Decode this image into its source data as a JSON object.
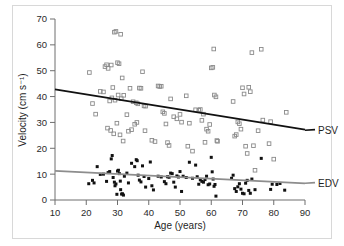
{
  "figure": {
    "background_color": "#ffffff",
    "border_color": "#d8d8d8"
  },
  "chart_data": {
    "type": "scatter",
    "title": "",
    "subtitle": "",
    "xlabel": "Age (years)",
    "ylabel": "Velocity (cm s⁻¹)",
    "xlim": [
      10,
      90
    ],
    "ylim": [
      0,
      70
    ],
    "xticks": [
      10,
      20,
      30,
      40,
      50,
      60,
      70,
      80,
      90
    ],
    "yticks": [
      0,
      10,
      20,
      30,
      40,
      50,
      60,
      70
    ],
    "xtick_labels": [
      "10",
      "20",
      "30",
      "40",
      "50",
      "60",
      "70",
      "80",
      "90"
    ],
    "ytick_labels": [
      "0",
      "10",
      "20",
      "30",
      "40",
      "50",
      "60",
      "70"
    ],
    "grid": false,
    "legend_position": "right-inline-labels",
    "annotations": [
      {
        "text": "PSV",
        "series": "PSV",
        "x": 90,
        "y": 27
      },
      {
        "text": "EDV",
        "series": "EDV",
        "x": 90,
        "y": 6.5
      }
    ],
    "series": [
      {
        "name": "PSV",
        "label": "PSV",
        "marker": "open-square",
        "marker_color": "#8a8a8a",
        "marker_fill": "none",
        "trendline": {
          "color": "#111111",
          "x_start": 10,
          "y_start": 42.8,
          "x_end": 90,
          "y_end": 27.2,
          "slope": -0.195,
          "intercept": 44.75
        },
        "points": [
          [
            21.0,
            49.3
          ],
          [
            22.0,
            37.3
          ],
          [
            23.0,
            33.2
          ],
          [
            24.5,
            42.0
          ],
          [
            25.5,
            41.8
          ],
          [
            26.0,
            51.6
          ],
          [
            26.5,
            52.3
          ],
          [
            27.0,
            50.9
          ],
          [
            28.0,
            52.2
          ],
          [
            28.5,
            43.5
          ],
          [
            29.0,
            64.9
          ],
          [
            29.5,
            65.2
          ],
          [
            30.0,
            53.1
          ],
          [
            30.5,
            52.7
          ],
          [
            31.0,
            64.1
          ],
          [
            31.5,
            47.2
          ],
          [
            27.5,
            38.3
          ],
          [
            28.2,
            39.5
          ],
          [
            29.2,
            38.6
          ],
          [
            30.2,
            40.6
          ],
          [
            31.2,
            39.2
          ],
          [
            32.0,
            40.5
          ],
          [
            33.0,
            33.0
          ],
          [
            34.0,
            43.2
          ],
          [
            35.0,
            38.0
          ],
          [
            36.0,
            37.6
          ],
          [
            36.5,
            37.2
          ],
          [
            37.0,
            43.3
          ],
          [
            37.5,
            43.2
          ],
          [
            38.0,
            49.6
          ],
          [
            38.5,
            36.4
          ],
          [
            39.0,
            36.3
          ],
          [
            26.8,
            27.8
          ],
          [
            27.8,
            26.9
          ],
          [
            28.8,
            25.6
          ],
          [
            29.8,
            29.7
          ],
          [
            30.8,
            25.2
          ],
          [
            31.8,
            22.8
          ],
          [
            33.5,
            26.6
          ],
          [
            34.5,
            27.2
          ],
          [
            35.5,
            29.3
          ],
          [
            36.2,
            30.0
          ],
          [
            38.8,
            26.8
          ],
          [
            41.0,
            23.1
          ],
          [
            42.0,
            22.6
          ],
          [
            43.0,
            44.1
          ],
          [
            43.5,
            43.9
          ],
          [
            44.0,
            44.0
          ],
          [
            44.5,
            34.1
          ],
          [
            45.0,
            33.5
          ],
          [
            45.5,
            29.4
          ],
          [
            46.0,
            22.2
          ],
          [
            46.5,
            21.1
          ],
          [
            47.0,
            39.1
          ],
          [
            48.0,
            32.2
          ],
          [
            49.0,
            31.4
          ],
          [
            50.0,
            33.1
          ],
          [
            50.5,
            30.1
          ],
          [
            52.0,
            40.3
          ],
          [
            52.5,
            20.8
          ],
          [
            53.0,
            29.7
          ],
          [
            54.0,
            18.9
          ],
          [
            55.0,
            34.9
          ],
          [
            56.0,
            34.7
          ],
          [
            56.5,
            35.0
          ],
          [
            57.0,
            30.8
          ],
          [
            57.5,
            33.2
          ],
          [
            58.0,
            22.3
          ],
          [
            58.5,
            27.4
          ],
          [
            59.0,
            26.6
          ],
          [
            59.5,
            29.2
          ],
          [
            60.0,
            51.1
          ],
          [
            60.5,
            51.3
          ],
          [
            60.8,
            58.4
          ],
          [
            61.0,
            40.6
          ],
          [
            61.5,
            39.9
          ],
          [
            61.8,
            23.0
          ],
          [
            62.0,
            22.7
          ],
          [
            67.0,
            38.1
          ],
          [
            67.5,
            24.7
          ],
          [
            68.0,
            25.3
          ],
          [
            68.5,
            30.2
          ],
          [
            69.0,
            29.5
          ],
          [
            69.5,
            27.4
          ],
          [
            70.0,
            43.4
          ],
          [
            70.5,
            41.0
          ],
          [
            71.0,
            20.8
          ],
          [
            71.5,
            18.0
          ],
          [
            72.0,
            43.6
          ],
          [
            72.5,
            41.9
          ],
          [
            73.0,
            57.0
          ],
          [
            73.5,
            21.0
          ],
          [
            74.0,
            11.5
          ],
          [
            75.0,
            26.8
          ],
          [
            76.0,
            58.3
          ],
          [
            76.5,
            30.9
          ],
          [
            78.5,
            21.8
          ],
          [
            79.0,
            30.3
          ],
          [
            80.0,
            15.8
          ],
          [
            84.0,
            33.9
          ]
        ]
      },
      {
        "name": "EDV",
        "label": "EDV",
        "marker": "filled-square",
        "marker_color": "#111111",
        "marker_fill": "#111111",
        "trendline": {
          "color": "#8d8d8d",
          "x_start": 10,
          "y_start": 11.3,
          "x_end": 90,
          "y_end": 6.4,
          "slope": -0.061,
          "intercept": 11.91
        },
        "points": [
          [
            20.8,
            6.3
          ],
          [
            22.0,
            7.6
          ],
          [
            22.5,
            6.6
          ],
          [
            23.5,
            12.9
          ],
          [
            24.5,
            9.9
          ],
          [
            25.5,
            10.0
          ],
          [
            26.5,
            7.2
          ],
          [
            27.0,
            10.6
          ],
          [
            27.5,
            11.0
          ],
          [
            28.0,
            15.9
          ],
          [
            28.3,
            17.2
          ],
          [
            28.6,
            8.7
          ],
          [
            29.0,
            6.9
          ],
          [
            29.2,
            5.5
          ],
          [
            29.5,
            6.2
          ],
          [
            29.8,
            2.2
          ],
          [
            30.0,
            11.2
          ],
          [
            30.3,
            11.5
          ],
          [
            30.6,
            10.2
          ],
          [
            30.9,
            7.3
          ],
          [
            31.0,
            4.0
          ],
          [
            31.3,
            2.3
          ],
          [
            31.6,
            2.4
          ],
          [
            31.9,
            1.9
          ],
          [
            32.2,
            9.2
          ],
          [
            33.0,
            10.4
          ],
          [
            33.5,
            6.6
          ],
          [
            34.5,
            14.2
          ],
          [
            35.5,
            12.9
          ],
          [
            36.0,
            15.6
          ],
          [
            36.3,
            15.2
          ],
          [
            36.6,
            9.6
          ],
          [
            37.0,
            7.7
          ],
          [
            37.5,
            7.0
          ],
          [
            38.0,
            13.2
          ],
          [
            38.5,
            9.1
          ],
          [
            39.0,
            5.0
          ],
          [
            40.0,
            8.3
          ],
          [
            40.5,
            14.7
          ],
          [
            41.0,
            5.5
          ],
          [
            41.5,
            3.9
          ],
          [
            43.0,
            9.2
          ],
          [
            44.0,
            8.9
          ],
          [
            45.0,
            7.1
          ],
          [
            45.5,
            6.3
          ],
          [
            46.0,
            9.0
          ],
          [
            46.5,
            8.8
          ],
          [
            47.0,
            10.4
          ],
          [
            47.5,
            10.2
          ],
          [
            48.0,
            6.9
          ],
          [
            48.5,
            5.0
          ],
          [
            49.0,
            9.3
          ],
          [
            49.5,
            8.9
          ],
          [
            50.0,
            11.0
          ],
          [
            50.5,
            3.3
          ],
          [
            51.0,
            9.2
          ],
          [
            52.0,
            8.7
          ],
          [
            53.0,
            14.6
          ],
          [
            54.0,
            8.4
          ],
          [
            55.0,
            13.5
          ],
          [
            55.5,
            9.0
          ],
          [
            56.0,
            6.1
          ],
          [
            56.5,
            7.8
          ],
          [
            57.0,
            7.2
          ],
          [
            57.5,
            6.9
          ],
          [
            58.0,
            7.9
          ],
          [
            58.5,
            9.2
          ],
          [
            59.0,
            5.9
          ],
          [
            59.5,
            6.2
          ],
          [
            60.0,
            16.5
          ],
          [
            60.3,
            10.9
          ],
          [
            60.6,
            8.1
          ],
          [
            60.9,
            5.3
          ],
          [
            61.2,
            6.0
          ],
          [
            61.5,
            1.5
          ],
          [
            66.5,
            8.4
          ],
          [
            67.0,
            9.6
          ],
          [
            67.5,
            4.4
          ],
          [
            68.0,
            3.3
          ],
          [
            68.5,
            5.1
          ],
          [
            69.0,
            6.3
          ],
          [
            69.5,
            4.2
          ],
          [
            70.0,
            2.6
          ],
          [
            70.5,
            2.4
          ],
          [
            71.0,
            6.5
          ],
          [
            71.5,
            7.6
          ],
          [
            72.0,
            3.7
          ],
          [
            72.5,
            2.6
          ],
          [
            73.0,
            8.1
          ],
          [
            74.0,
            4.0
          ],
          [
            76.0,
            16.1
          ],
          [
            79.0,
            4.1
          ],
          [
            79.5,
            6.1
          ],
          [
            81.0,
            6.0
          ],
          [
            82.0,
            6.4
          ],
          [
            83.5,
            3.8
          ]
        ]
      }
    ]
  }
}
